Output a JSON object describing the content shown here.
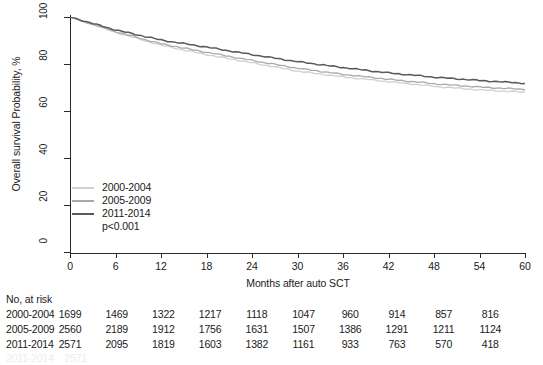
{
  "chart_data": {
    "type": "line",
    "title": "",
    "xlabel": "Months after auto SCT",
    "ylabel": "Overall survival Probability, %",
    "xlim": [
      0,
      60
    ],
    "ylim": [
      0,
      100
    ],
    "xticks": [
      0,
      6,
      12,
      18,
      24,
      30,
      36,
      42,
      48,
      54,
      60
    ],
    "yticks": [
      0,
      20,
      40,
      60,
      80,
      100
    ],
    "grid": false,
    "legend_position": "lower-left-inside",
    "annotations": [
      "p<0.001"
    ],
    "x": [
      0,
      6,
      12,
      18,
      24,
      30,
      36,
      42,
      48,
      54,
      60
    ],
    "series": [
      {
        "name": "2000-2004",
        "color": "#d0d0d0",
        "values": [
          100,
          93.5,
          88.0,
          84.0,
          80.5,
          77.0,
          74.5,
          72.5,
          70.5,
          69.0,
          68.0
        ]
      },
      {
        "name": "2005-2009",
        "color": "#a9a9a9",
        "values": [
          100,
          93.8,
          88.6,
          85.0,
          81.5,
          78.2,
          75.6,
          73.5,
          71.6,
          70.2,
          69.2
        ]
      },
      {
        "name": "2011-2014",
        "color": "#5a5a5a",
        "values": [
          100,
          94.5,
          90.2,
          87.2,
          84.0,
          81.0,
          78.5,
          76.2,
          74.4,
          73.0,
          71.8
        ]
      }
    ]
  },
  "legend": {
    "items": [
      {
        "label": "2000-2004",
        "color": "#d0d0d0"
      },
      {
        "label": "2005-2009",
        "color": "#a9a9a9"
      },
      {
        "label": "2011-2014",
        "color": "#5a5a5a"
      }
    ],
    "pvalue": "p<0.001"
  },
  "risk_table": {
    "title": "No, at risk",
    "columns": [
      0,
      6,
      12,
      18,
      24,
      30,
      36,
      42,
      48,
      54,
      60
    ],
    "rows": [
      {
        "label": "2000-2004",
        "values": [
          1699,
          1469,
          1322,
          1217,
          1118,
          1047,
          960,
          914,
          857,
          816
        ]
      },
      {
        "label": "2005-2009",
        "values": [
          2560,
          2189,
          1912,
          1756,
          1631,
          1507,
          1386,
          1291,
          1211,
          1124
        ]
      },
      {
        "label": "2011-2014",
        "values": [
          2571,
          2095,
          1819,
          1603,
          1382,
          1161,
          933,
          763,
          570,
          418
        ]
      }
    ]
  }
}
